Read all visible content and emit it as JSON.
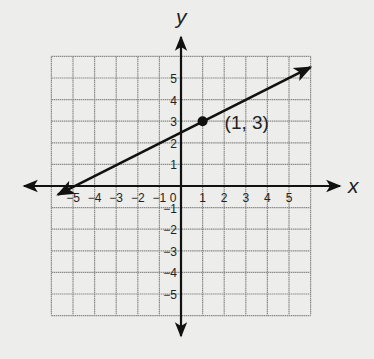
{
  "chart_data": {
    "type": "line",
    "title": "",
    "xlabel": "x",
    "ylabel": "y",
    "xlim": [
      -6,
      6
    ],
    "ylim": [
      -6,
      6
    ],
    "grid": true,
    "x_ticks": [
      -5,
      -4,
      -3,
      -2,
      -1,
      0,
      1,
      2,
      3,
      4,
      5
    ],
    "y_ticks": [
      -5,
      -4,
      -3,
      -2,
      -1,
      1,
      2,
      3,
      4,
      5
    ],
    "x_tick_labels": [
      "−5",
      "−4",
      "−3",
      "−2",
      "−1",
      "0",
      "1",
      "2",
      "3",
      "4",
      "5"
    ],
    "y_tick_labels": [
      "−5",
      "−4",
      "−3",
      "−2",
      "−1",
      "1",
      "2",
      "3",
      "4",
      "5"
    ],
    "series": [
      {
        "name": "line",
        "x": [
          -5.7,
          6
        ],
        "y": [
          -0.4,
          5.5
        ],
        "slope": 0.5,
        "intercept": 2.5
      }
    ],
    "points": [
      {
        "x": 1,
        "y": 3,
        "label": "(1, 3)"
      }
    ],
    "annotations": [
      "(1, 3)"
    ]
  },
  "colors": {
    "background": "#ededeb",
    "grid": "#8a8a8a",
    "axis": "#111111",
    "line": "#111111"
  }
}
